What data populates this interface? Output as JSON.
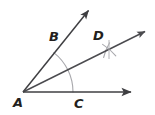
{
  "figure": {
    "title": "Angle bisector construction diagram",
    "background_color": "#ffffff",
    "stroke_color": "#3f3f42",
    "ray_color": "#4b4b4f",
    "arc_color": "#a8a8ac",
    "label_color": "#231f20"
  },
  "labels": [
    {
      "id": "label-a",
      "text": "A",
      "x": 13,
      "y": 107,
      "name": "vertex-label-a"
    },
    {
      "id": "label-b",
      "text": "B",
      "x": 49,
      "y": 41,
      "name": "point-label-b"
    },
    {
      "id": "label-c",
      "text": "C",
      "x": 74,
      "y": 108,
      "name": "point-label-c"
    },
    {
      "id": "label-d",
      "text": "D",
      "x": 93,
      "y": 40,
      "name": "point-label-d"
    }
  ],
  "geometry": {
    "vertex": {
      "label": "A",
      "x": 23,
      "y": 92
    },
    "rays": [
      {
        "id": "ray-ab",
        "name": "ray-upper-through-b",
        "from": {
          "x": 23,
          "y": 92
        },
        "to": {
          "x": 91,
          "y": 8
        },
        "arrowhead": true,
        "through_point": "B"
      },
      {
        "id": "ray-ad",
        "name": "ray-bisector-through-d",
        "from": {
          "x": 23,
          "y": 92
        },
        "to": {
          "x": 148,
          "y": 30
        },
        "arrowhead": true,
        "through_point": "D"
      },
      {
        "id": "ray-ac",
        "name": "ray-horizontal-through-c",
        "from": {
          "x": 23,
          "y": 92
        },
        "to": {
          "x": 134,
          "y": 92
        },
        "arrowhead": true,
        "through_point": "C"
      }
    ],
    "arcs": [
      {
        "id": "arc-bc",
        "name": "compass-arc-from-vertex",
        "description": "Large arc centered at A crossing both sides of the angle at B and C",
        "center": {
          "x": 23,
          "y": 92
        },
        "radius": 50,
        "start_angle_deg": 0,
        "end_angle_deg": 52
      },
      {
        "id": "arc-d-1",
        "name": "compass-arc-from-b",
        "description": "Small arc centered at B crossing near D",
        "center": {
          "x": 56,
          "y": 48
        },
        "radius": 54,
        "start_angle_deg": 6,
        "end_angle_deg": 26
      },
      {
        "id": "arc-d-2",
        "name": "compass-arc-from-c",
        "description": "Small arc centered at C crossing near D",
        "center": {
          "x": 72,
          "y": 92
        },
        "radius": 54,
        "start_angle_deg": 42,
        "end_angle_deg": 62
      }
    ],
    "tick_marks": [
      {
        "id": "tick-b",
        "name": "intersection-tick-b",
        "x": 56,
        "y": 48,
        "description": "arc intersection tick on ray AB at point B"
      },
      {
        "id": "tick-c",
        "name": "intersection-tick-c",
        "x": 72,
        "y": 92,
        "description": "arc intersection tick on ray AC at point C"
      },
      {
        "id": "tick-d",
        "name": "intersection-tick-d",
        "x": 109,
        "y": 49,
        "description": "arc intersection cross at point D on the bisector"
      }
    ]
  }
}
